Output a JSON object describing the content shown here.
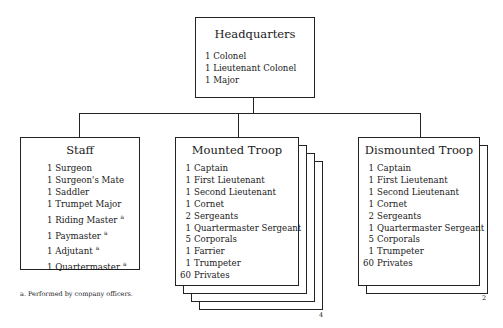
{
  "headquarters": {
    "title": "Headquarters",
    "items": [
      {
        "qty": "1",
        "role": "Colonel"
      },
      {
        "qty": "1",
        "role": "Lieutenant Colonel"
      },
      {
        "qty": "1",
        "role": "Major"
      }
    ]
  },
  "staff": {
    "title": "Staff",
    "items": [
      {
        "qty": "1",
        "role": "Surgeon",
        "note": ""
      },
      {
        "qty": "1",
        "role": "Surgeon's Mate",
        "note": ""
      },
      {
        "qty": "1",
        "role": "Saddler",
        "note": ""
      },
      {
        "qty": "1",
        "role": "Trumpet Major",
        "note": ""
      },
      {
        "qty": "1",
        "role": "Riding Master",
        "note": "a"
      },
      {
        "qty": "1",
        "role": "Paymaster",
        "note": "a"
      },
      {
        "qty": "1",
        "role": "Adjutant",
        "note": "a"
      },
      {
        "qty": "1",
        "role": "Quartermaster",
        "note": "a"
      }
    ]
  },
  "mounted_troop": {
    "title": "Mounted Troop",
    "count": "4",
    "items": [
      {
        "qty": "1",
        "role": "Captain"
      },
      {
        "qty": "1",
        "role": "First Lieutenant"
      },
      {
        "qty": "1",
        "role": "Second Lieutenant"
      },
      {
        "qty": "1",
        "role": "Cornet"
      },
      {
        "qty": "2",
        "role": "Sergeants"
      },
      {
        "qty": "1",
        "role": "Quartermaster Sergeant"
      },
      {
        "qty": "5",
        "role": "Corporals"
      },
      {
        "qty": "1",
        "role": "Farrier"
      },
      {
        "qty": "1",
        "role": "Trumpeter"
      },
      {
        "qty": "60",
        "role": "Privates"
      }
    ]
  },
  "dismounted_troop": {
    "title": "Dismounted Troop",
    "count": "2",
    "items": [
      {
        "qty": "1",
        "role": "Captain"
      },
      {
        "qty": "1",
        "role": "First Lieutenant"
      },
      {
        "qty": "1",
        "role": "Second Lieutenant"
      },
      {
        "qty": "1",
        "role": "Cornet"
      },
      {
        "qty": "2",
        "role": "Sergeants"
      },
      {
        "qty": "1",
        "role": "Quartermaster Sergeant"
      },
      {
        "qty": "5",
        "role": "Corporals"
      },
      {
        "qty": "1",
        "role": "Trumpeter"
      },
      {
        "qty": "60",
        "role": "Privates"
      }
    ]
  },
  "footnote": "a. Performed by company officers."
}
